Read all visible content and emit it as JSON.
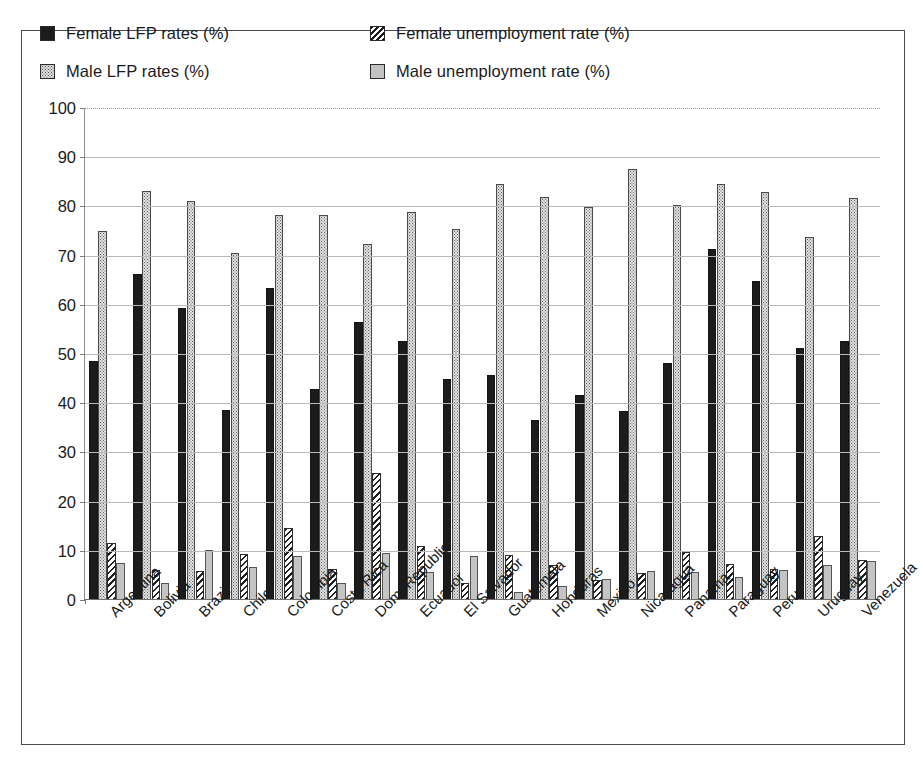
{
  "legend": {
    "items": [
      {
        "label": "Female LFP rates (%)",
        "icon": "solid-black-square-icon",
        "swatch": "sw-solid-black"
      },
      {
        "label": "Female unemployment rate (%)",
        "icon": "diagonal-hatch-square-icon",
        "swatch": "sw-hatch"
      },
      {
        "label": "Male LFP rates (%)",
        "icon": "dotted-square-icon",
        "swatch": "sw-dots"
      },
      {
        "label": "Male unemployment rate (%)",
        "icon": "gray-square-icon",
        "swatch": "sw-gray"
      }
    ]
  },
  "axis": {
    "y_ticks": [
      "100",
      "90",
      "80",
      "70",
      "60",
      "50",
      "40",
      "30",
      "20",
      "10",
      "0"
    ]
  },
  "colors": {
    "female_lfp": "#1c1c1c",
    "male_lfp": "#e4e4e4",
    "female_unemployment": "#fcfcfc",
    "male_unemployment": "#c4c4c4",
    "gridline": "#b9b9b9",
    "axis": "#6f6f6f",
    "frame": "#4a4a4a",
    "text": "#1a1a1a"
  },
  "chart_data": {
    "type": "bar",
    "title": "",
    "subtitle": "",
    "xlabel": "",
    "ylabel": "",
    "ylim": [
      0,
      100
    ],
    "ytick_step": 10,
    "grid": true,
    "legend_position": "top",
    "categories": [
      "Argentina",
      "Bolivia",
      "Brazil",
      "Chile",
      "Colombia",
      "Costa Rica",
      "Dom. Republic",
      "Ecuador",
      "El Salvador",
      "Guatemala",
      "Honduras",
      "Mexico",
      "Nicaragua",
      "Panama",
      "Paraguay",
      "Peru",
      "Uruguay",
      "Venezuela"
    ],
    "series": [
      {
        "name": "Female LFP rates (%)",
        "values": [
          48.3,
          66.1,
          59.1,
          38.4,
          63.2,
          42.6,
          56.4,
          52.5,
          44.7,
          45.6,
          36.3,
          41.4,
          38.3,
          47.9,
          71.2,
          64.7,
          51.0,
          52.4
        ]
      },
      {
        "name": "Male LFP rates (%)",
        "values": [
          74.7,
          83.0,
          80.9,
          70.4,
          78.0,
          78.1,
          72.1,
          78.7,
          75.3,
          84.3,
          81.8,
          79.6,
          87.3,
          80.1,
          84.3,
          82.8,
          73.6,
          81.5
        ]
      },
      {
        "name": "Female unemployment rate (%)",
        "values": [
          11.3,
          5.8,
          5.6,
          9.1,
          14.4,
          6.2,
          25.6,
          10.8,
          3.2,
          9.0,
          6.9,
          3.9,
          5.2,
          9.5,
          7.2,
          6.2,
          12.9,
          8.0
        ]
      },
      {
        "name": "Male unemployment rate (%)",
        "values": [
          7.4,
          3.3,
          9.9,
          6.6,
          8.8,
          3.2,
          9.3,
          5.5,
          8.7,
          1.5,
          2.6,
          4.1,
          5.6,
          5.4,
          4.4,
          5.9,
          6.9,
          7.8
        ]
      }
    ]
  }
}
